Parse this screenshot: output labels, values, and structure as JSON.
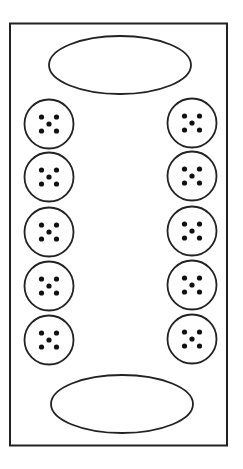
{
  "board": {
    "type": "mancala",
    "stroke_color": "#222222",
    "background": "#ffffff",
    "stores": [
      {
        "name": "top-store",
        "seeds": 0
      },
      {
        "name": "bottom-store",
        "seeds": 0
      }
    ],
    "left_pits": [
      5,
      5,
      5,
      5,
      5
    ],
    "right_pits": [
      5,
      5,
      5,
      5,
      5
    ]
  }
}
